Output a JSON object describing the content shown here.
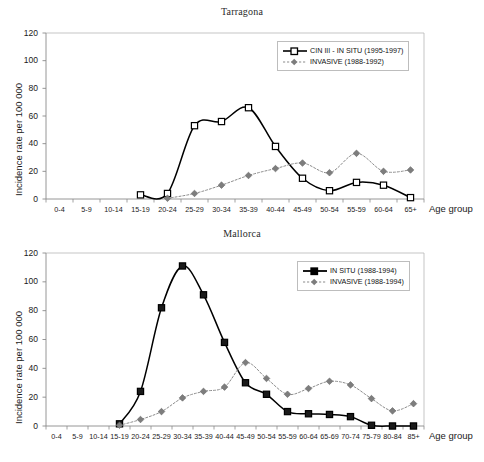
{
  "figure": {
    "axis_title_x": "Age group",
    "axis_title_y": "Incidence rate per 100 000"
  },
  "charts": [
    {
      "id": "tarragona",
      "title": "Tarragona",
      "ylabel": "Incidence rate per 100 000",
      "xlabel": "Age group",
      "yticks": [
        "0",
        "20",
        "40",
        "60",
        "80",
        "100",
        "120"
      ],
      "categories": [
        "0-4",
        "5-9",
        "10-14",
        "15-19",
        "20-24",
        "25-29",
        "30-34",
        "35-39",
        "40-44",
        "45-49",
        "50-54",
        "55-59",
        "60-64",
        "65+"
      ],
      "legend": [
        {
          "label": "CIN III - IN SITU (1995-1997)",
          "marker": "open-square",
          "line": "solid",
          "color": "#000000"
        },
        {
          "label": "INVASIVE (1988-1992)",
          "marker": "dot",
          "line": "dotted",
          "color": "#8c8c8c"
        }
      ]
    },
    {
      "id": "mallorca",
      "title": "Mallorca",
      "ylabel": "Incidence rate per 100 000",
      "xlabel": "Age group",
      "yticks": [
        "0",
        "20",
        "40",
        "60",
        "80",
        "100",
        "120"
      ],
      "categories": [
        "0-4",
        "5-9",
        "10-14",
        "15-19",
        "20-24",
        "25-29",
        "30-34",
        "35-39",
        "40-44",
        "45-49",
        "50-54",
        "55-59",
        "60-64",
        "65-69",
        "70-74",
        "75-79",
        "80-84",
        "85+"
      ],
      "legend": [
        {
          "label": "IN SITU (1988-1994)",
          "marker": "filled-square",
          "line": "solid",
          "color": "#000000"
        },
        {
          "label": "INVASIVE (1988-1994)",
          "marker": "dot",
          "line": "dotted",
          "color": "#8c8c8c"
        }
      ]
    }
  ],
  "chart_data": [
    {
      "type": "line",
      "title": "Tarragona",
      "xlabel": "Age group",
      "ylabel": "Incidence rate per 100 000",
      "ylim": [
        0,
        120
      ],
      "ytick_step": 20,
      "grid": false,
      "legend_position": "top-right",
      "categories": [
        "0-4",
        "5-9",
        "10-14",
        "15-19",
        "20-24",
        "25-29",
        "30-34",
        "35-39",
        "40-44",
        "45-49",
        "50-54",
        "55-59",
        "60-64",
        "65+"
      ],
      "series": [
        {
          "name": "CIN III - IN SITU (1995-1997)",
          "style": "solid",
          "marker": "open-square",
          "color": "#000000",
          "values": [
            null,
            null,
            null,
            3,
            4,
            53,
            56,
            66,
            38,
            15,
            6,
            12,
            10,
            1
          ]
        },
        {
          "name": "INVASIVE (1988-1992)",
          "style": "dotted",
          "marker": "dot",
          "color": "#8c8c8c",
          "values": [
            null,
            null,
            null,
            null,
            0.5,
            4,
            10,
            17,
            22,
            26,
            19,
            33,
            20,
            21
          ]
        }
      ]
    },
    {
      "type": "line",
      "title": "Mallorca",
      "xlabel": "Age group",
      "ylabel": "Incidence rate per 100 000",
      "ylim": [
        0,
        120
      ],
      "ytick_step": 20,
      "grid": false,
      "legend_position": "top-right",
      "categories": [
        "0-4",
        "5-9",
        "10-14",
        "15-19",
        "20-24",
        "25-29",
        "30-34",
        "35-39",
        "40-44",
        "45-49",
        "50-54",
        "55-59",
        "60-64",
        "65-69",
        "70-74",
        "75-79",
        "80-84",
        "85+"
      ],
      "series": [
        {
          "name": "IN SITU (1988-1994)",
          "style": "solid",
          "marker": "filled-square",
          "color": "#000000",
          "values": [
            null,
            null,
            null,
            1.5,
            24,
            82,
            111,
            91,
            58,
            30,
            22,
            10,
            8.5,
            8,
            6.5,
            0.5,
            0,
            0
          ]
        },
        {
          "name": "INVASIVE (1988-1994)",
          "style": "dotted",
          "marker": "dot",
          "color": "#8c8c8c",
          "values": [
            null,
            null,
            null,
            0.5,
            4.5,
            10,
            19.5,
            24,
            27,
            44,
            33,
            22,
            26,
            31,
            28.5,
            19,
            10.5,
            15.5
          ]
        }
      ]
    }
  ]
}
